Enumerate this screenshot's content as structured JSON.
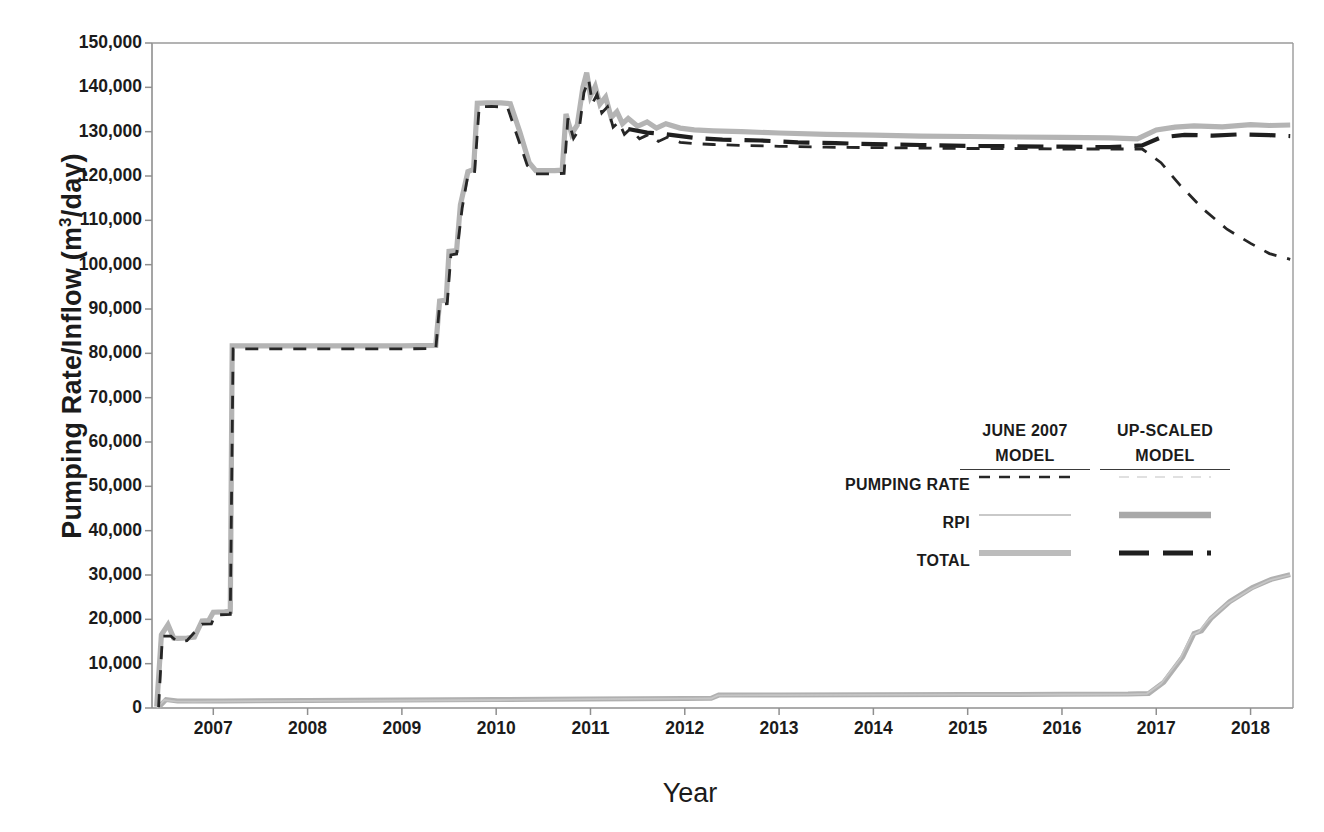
{
  "chart_data": {
    "type": "line",
    "title": "",
    "xlabel": "Year",
    "ylabel": "Pumping Rate/Inflow (m3/day)",
    "ylabel_html": "Pumping Rate/Inflow (m<sup>3</sup>/day)",
    "xlim": [
      2006.35,
      2018.45
    ],
    "ylim": [
      0,
      150000
    ],
    "ytick_labels": [
      "150,000",
      "140,000",
      "130,000",
      "120,000",
      "110,000",
      "100,000",
      "90,000",
      "80,000",
      "70,000",
      "60,000",
      "50,000",
      "40,000",
      "30,000",
      "20,000",
      "10,000",
      "0"
    ],
    "ytick_values": [
      150000,
      140000,
      130000,
      120000,
      110000,
      100000,
      90000,
      80000,
      70000,
      60000,
      50000,
      40000,
      30000,
      20000,
      10000,
      0
    ],
    "xtick_labels": [
      "2007",
      "2008",
      "2009",
      "2010",
      "2011",
      "2012",
      "2013",
      "2014",
      "2015",
      "2016",
      "2017",
      "2018"
    ],
    "xtick_values": [
      2007,
      2008,
      2009,
      2010,
      2011,
      2012,
      2013,
      2014,
      2015,
      2016,
      2017,
      2018
    ],
    "grid": false,
    "legend_position": "center-right",
    "series": [
      {
        "name": "TOTAL (June 2007 model)",
        "style": "thick-gray-solid",
        "color": "#b4b4b4",
        "points": [
          [
            2006.4,
            300
          ],
          [
            2006.45,
            16500
          ],
          [
            2006.52,
            18800
          ],
          [
            2006.58,
            15800
          ],
          [
            2006.62,
            15700
          ],
          [
            2006.72,
            15800
          ],
          [
            2006.8,
            16000
          ],
          [
            2006.88,
            19600
          ],
          [
            2006.95,
            19700
          ],
          [
            2007.0,
            21600
          ],
          [
            2007.12,
            21700
          ],
          [
            2007.18,
            21800
          ],
          [
            2007.2,
            81700
          ],
          [
            2008.0,
            81700
          ],
          [
            2009.0,
            81700
          ],
          [
            2009.36,
            81800
          ],
          [
            2009.4,
            91800
          ],
          [
            2009.47,
            92000
          ],
          [
            2009.5,
            103000
          ],
          [
            2009.58,
            103200
          ],
          [
            2009.62,
            113500
          ],
          [
            2009.7,
            121000
          ],
          [
            2009.76,
            121500
          ],
          [
            2009.8,
            136400
          ],
          [
            2009.9,
            136500
          ],
          [
            2010.05,
            136500
          ],
          [
            2010.15,
            136300
          ],
          [
            2010.25,
            130000
          ],
          [
            2010.35,
            123000
          ],
          [
            2010.42,
            121200
          ],
          [
            2010.62,
            121200
          ],
          [
            2010.7,
            121300
          ],
          [
            2010.74,
            134000
          ],
          [
            2010.8,
            129500
          ],
          [
            2010.86,
            131500
          ],
          [
            2010.92,
            140000
          ],
          [
            2010.96,
            143300
          ],
          [
            2011.0,
            138000
          ],
          [
            2011.05,
            140200
          ],
          [
            2011.1,
            136200
          ],
          [
            2011.16,
            137800
          ],
          [
            2011.22,
            133200
          ],
          [
            2011.28,
            134500
          ],
          [
            2011.34,
            131800
          ],
          [
            2011.4,
            133000
          ],
          [
            2011.5,
            131200
          ],
          [
            2011.6,
            132200
          ],
          [
            2011.7,
            130800
          ],
          [
            2011.8,
            131800
          ],
          [
            2011.95,
            130800
          ],
          [
            2012.1,
            130400
          ],
          [
            2012.3,
            130200
          ],
          [
            2012.6,
            130000
          ],
          [
            2013.0,
            129700
          ],
          [
            2013.5,
            129400
          ],
          [
            2014.0,
            129200
          ],
          [
            2014.5,
            129000
          ],
          [
            2015.0,
            128900
          ],
          [
            2015.5,
            128800
          ],
          [
            2016.0,
            128700
          ],
          [
            2016.5,
            128600
          ],
          [
            2016.8,
            128400
          ],
          [
            2017.0,
            130400
          ],
          [
            2017.2,
            131000
          ],
          [
            2017.4,
            131300
          ],
          [
            2017.7,
            131100
          ],
          [
            2018.0,
            131600
          ],
          [
            2018.2,
            131400
          ],
          [
            2018.42,
            131500
          ]
        ]
      },
      {
        "name": "PUMPING RATE (June 2007 model)",
        "style": "black-dashed",
        "color": "#262626",
        "points": [
          [
            2006.42,
            200
          ],
          [
            2006.46,
            16200
          ],
          [
            2006.55,
            16200
          ],
          [
            2006.62,
            14900
          ],
          [
            2006.72,
            15200
          ],
          [
            2006.88,
            18900
          ],
          [
            2006.98,
            19000
          ],
          [
            2007.02,
            21000
          ],
          [
            2007.18,
            21100
          ],
          [
            2007.21,
            81000
          ],
          [
            2008.0,
            81000
          ],
          [
            2009.0,
            81000
          ],
          [
            2009.36,
            81100
          ],
          [
            2009.4,
            91000
          ],
          [
            2009.48,
            91200
          ],
          [
            2009.52,
            102200
          ],
          [
            2009.58,
            102400
          ],
          [
            2009.64,
            112800
          ],
          [
            2009.7,
            120200
          ],
          [
            2009.77,
            120600
          ],
          [
            2009.82,
            135600
          ],
          [
            2009.95,
            135700
          ],
          [
            2010.12,
            135500
          ],
          [
            2010.22,
            129200
          ],
          [
            2010.33,
            122400
          ],
          [
            2010.42,
            120500
          ],
          [
            2010.62,
            120500
          ],
          [
            2010.72,
            120600
          ],
          [
            2010.76,
            133000
          ],
          [
            2010.82,
            128500
          ],
          [
            2010.88,
            130500
          ],
          [
            2010.93,
            138800
          ],
          [
            2010.98,
            141800
          ],
          [
            2011.02,
            136400
          ],
          [
            2011.07,
            138400
          ],
          [
            2011.12,
            134200
          ],
          [
            2011.18,
            135600
          ],
          [
            2011.24,
            131000
          ],
          [
            2011.3,
            132200
          ],
          [
            2011.36,
            129400
          ],
          [
            2011.42,
            130600
          ],
          [
            2011.52,
            128400
          ],
          [
            2011.62,
            129400
          ],
          [
            2011.72,
            127800
          ],
          [
            2011.82,
            128800
          ],
          [
            2011.95,
            127600
          ],
          [
            2012.1,
            127300
          ],
          [
            2012.3,
            127100
          ],
          [
            2012.6,
            126900
          ],
          [
            2013.0,
            126700
          ],
          [
            2013.5,
            126500
          ],
          [
            2014.0,
            126400
          ],
          [
            2014.5,
            126300
          ],
          [
            2015.0,
            126200
          ],
          [
            2015.5,
            126200
          ],
          [
            2016.0,
            126100
          ],
          [
            2016.5,
            126100
          ],
          [
            2016.85,
            126100
          ],
          [
            2017.05,
            123000
          ],
          [
            2017.25,
            118000
          ],
          [
            2017.5,
            112500
          ],
          [
            2017.75,
            108000
          ],
          [
            2018.0,
            104800
          ],
          [
            2018.2,
            102500
          ],
          [
            2018.42,
            101200
          ]
        ]
      },
      {
        "name": "TOTAL (Up-scaled model)",
        "style": "black-thick-dashed",
        "color": "#1f1f1f",
        "points": [
          [
            2011.4,
            130600
          ],
          [
            2011.6,
            129800
          ],
          [
            2011.8,
            129400
          ],
          [
            2012.1,
            128600
          ],
          [
            2012.4,
            128200
          ],
          [
            2012.8,
            128000
          ],
          [
            2013.2,
            127600
          ],
          [
            2013.6,
            127400
          ],
          [
            2014.0,
            127200
          ],
          [
            2014.5,
            127000
          ],
          [
            2015.0,
            126800
          ],
          [
            2015.5,
            126700
          ],
          [
            2016.0,
            126600
          ],
          [
            2016.5,
            126500
          ],
          [
            2016.85,
            126900
          ],
          [
            2017.05,
            128700
          ],
          [
            2017.3,
            129300
          ],
          [
            2017.6,
            129100
          ],
          [
            2017.9,
            129400
          ],
          [
            2018.2,
            129200
          ],
          [
            2018.42,
            129000
          ]
        ]
      },
      {
        "name": "RPI (June 2007 model)",
        "style": "thin-gray",
        "color": "#c3c3c3",
        "points": [
          [
            2006.4,
            100
          ],
          [
            2006.48,
            1800
          ],
          [
            2006.6,
            1500
          ],
          [
            2006.8,
            1450
          ],
          [
            2007.0,
            1500
          ],
          [
            2008.0,
            1600
          ],
          [
            2009.0,
            1700
          ],
          [
            2010.0,
            1800
          ],
          [
            2011.0,
            2000
          ],
          [
            2012.0,
            2100
          ],
          [
            2012.28,
            2150
          ],
          [
            2012.35,
            2850
          ],
          [
            2013.0,
            2900
          ],
          [
            2014.0,
            2950
          ],
          [
            2015.0,
            3000
          ],
          [
            2016.0,
            3050
          ],
          [
            2016.7,
            3100
          ],
          [
            2016.9,
            3200
          ],
          [
            2017.05,
            5500
          ],
          [
            2017.25,
            11000
          ],
          [
            2017.38,
            16500
          ],
          [
            2017.45,
            17200
          ],
          [
            2017.55,
            19800
          ],
          [
            2017.75,
            23500
          ],
          [
            2018.0,
            26800
          ],
          [
            2018.2,
            28800
          ],
          [
            2018.42,
            30000
          ]
        ]
      },
      {
        "name": "RPI (Up-scaled model)",
        "style": "gray-thick",
        "color": "#b0b0b0",
        "points": [
          [
            2006.42,
            150
          ],
          [
            2006.5,
            1900
          ],
          [
            2006.62,
            1600
          ],
          [
            2006.85,
            1550
          ],
          [
            2007.1,
            1600
          ],
          [
            2008.0,
            1700
          ],
          [
            2009.0,
            1800
          ],
          [
            2010.0,
            1900
          ],
          [
            2011.0,
            2050
          ],
          [
            2012.0,
            2150
          ],
          [
            2012.28,
            2200
          ],
          [
            2012.36,
            2900
          ],
          [
            2013.0,
            2950
          ],
          [
            2014.0,
            3000
          ],
          [
            2015.0,
            3050
          ],
          [
            2016.0,
            3100
          ],
          [
            2016.7,
            3150
          ],
          [
            2016.92,
            3300
          ],
          [
            2017.08,
            5800
          ],
          [
            2017.28,
            11500
          ],
          [
            2017.4,
            16800
          ],
          [
            2017.48,
            17400
          ],
          [
            2017.58,
            20200
          ],
          [
            2017.78,
            24000
          ],
          [
            2018.02,
            27200
          ],
          [
            2018.22,
            29000
          ],
          [
            2018.42,
            30100
          ]
        ]
      }
    ]
  },
  "legend": {
    "columns": [
      {
        "line1": "JUNE 2007",
        "line2": "MODEL"
      },
      {
        "line1": "UP-SCALED",
        "line2": "MODEL"
      }
    ],
    "rows": [
      {
        "label": "PUMPING RATE",
        "june2007_style": "black-dashed",
        "upscaled_style": "faint-gray-thin"
      },
      {
        "label": "RPI",
        "june2007_style": "thin-light-gray",
        "upscaled_style": "gray-thick"
      },
      {
        "label": "TOTAL",
        "june2007_style": "gray-thick-light",
        "upscaled_style": "black-thick-dashed"
      }
    ]
  },
  "colors": {
    "axis": "#8a8a8a",
    "gray_total": "#b4b4b4",
    "gray_rpi": "#bdbdbd",
    "black_dash": "#262626",
    "text": "#1b1b1b"
  }
}
